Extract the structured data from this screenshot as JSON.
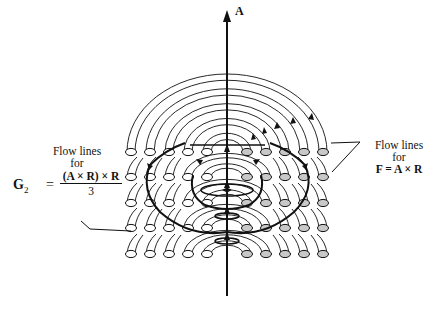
{
  "axis": {
    "label": "A"
  },
  "left_annotation": {
    "line1": "Flow lines",
    "line2": "for",
    "lhs": "G",
    "lhs_sub": "2",
    "equals": "=",
    "numerator": "(A × R) × R",
    "denominator": "3"
  },
  "right_annotation": {
    "line1": "Flow lines",
    "line2": "for",
    "formula": "F = A × R"
  },
  "colors": {
    "line": "#111111",
    "tube_end_left": "#ffffff",
    "tube_end_right": "#c8c8c8",
    "background": "#ffffff"
  },
  "grid": {
    "rows": 5,
    "columns_per_side": 5,
    "row_y": [
      152,
      177,
      203,
      228,
      254
    ],
    "left_x": [
      131,
      150,
      169,
      188,
      207
    ],
    "right_x": [
      247,
      266,
      285,
      304,
      323
    ]
  }
}
